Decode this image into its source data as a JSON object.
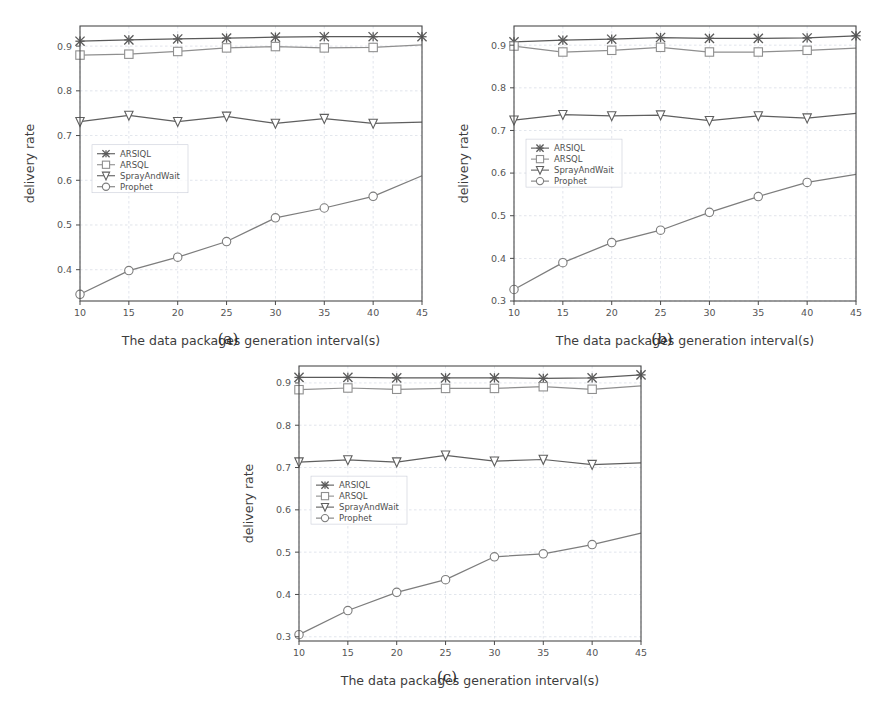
{
  "figure": {
    "panels": [
      {
        "id": "a",
        "caption": "(a)"
      },
      {
        "id": "b",
        "caption": "(b)"
      },
      {
        "id": "c",
        "caption": "(c)"
      }
    ]
  },
  "captions": {
    "a": "(a)",
    "b": "(b)",
    "c": "(c)"
  },
  "axis": {
    "xlabel": "The data packages generation interval(s)",
    "ylabel": "delivery rate"
  },
  "legend": {
    "entries": [
      "ARSIQL",
      "ARSQL",
      "SprayAndWait",
      "Prophet"
    ],
    "markers": [
      "x-marker-icon",
      "square-marker-icon",
      "triangle-down-marker-icon",
      "circle-marker-icon"
    ]
  },
  "colors": {
    "arsiql": "#5a5a5a",
    "arsql": "#8f8f8f",
    "sprayandwait": "#5f5f5f",
    "prophet": "#7d7d7d",
    "grid": "#cfd4e0",
    "axis": "#4a4a4a",
    "background": "#ffffff"
  },
  "chart_data": [
    {
      "type": "line",
      "panel": "(a)",
      "title": "",
      "xlabel": "The data packages generation interval(s)",
      "ylabel": "delivery rate",
      "x": [
        10,
        15,
        20,
        25,
        30,
        35,
        40,
        45
      ],
      "xlim": [
        10,
        45
      ],
      "ylim": [
        0.33,
        0.945
      ],
      "xticks": [
        10,
        15,
        20,
        25,
        30,
        35,
        40,
        45
      ],
      "yticks": [
        0.4,
        0.5,
        0.6,
        0.7,
        0.8,
        0.9
      ],
      "ytick_labels": [
        "0.4",
        "0.5",
        "0.6",
        "0.7",
        "0.8",
        "0.9"
      ],
      "grid": true,
      "legend_position": "center-left",
      "series": [
        {
          "name": "ARSIQL",
          "marker": "x",
          "values": [
            0.911,
            0.914,
            0.916,
            0.918,
            0.92,
            0.921,
            0.921,
            0.921
          ]
        },
        {
          "name": "ARSQL",
          "marker": "square",
          "values": [
            0.88,
            0.882,
            0.888,
            0.896,
            0.899,
            0.896,
            0.897,
            0.903
          ]
        },
        {
          "name": "SprayAndWait",
          "marker": "triangle",
          "values": [
            0.731,
            0.745,
            0.731,
            0.743,
            0.727,
            0.738,
            0.727,
            0.73
          ]
        },
        {
          "name": "Prophet",
          "marker": "circle",
          "values": [
            0.345,
            0.398,
            0.428,
            0.463,
            0.516,
            0.538,
            0.564,
            0.61
          ]
        }
      ]
    },
    {
      "type": "line",
      "panel": "(b)",
      "title": "",
      "xlabel": "The data packages generation interval(s)",
      "ylabel": "delivery rate",
      "x": [
        10,
        15,
        20,
        25,
        30,
        35,
        40,
        45
      ],
      "xlim": [
        10,
        45
      ],
      "ylim": [
        0.3,
        0.945
      ],
      "xticks": [
        10,
        15,
        20,
        25,
        30,
        35,
        40,
        45
      ],
      "yticks": [
        0.3,
        0.4,
        0.5,
        0.6,
        0.7,
        0.8,
        0.9
      ],
      "ytick_labels": [
        "0.3",
        "0.4",
        "0.5",
        "0.6",
        "0.7",
        "0.8",
        "0.9"
      ],
      "grid": true,
      "legend_position": "center-left",
      "series": [
        {
          "name": "ARSIQL",
          "marker": "x",
          "values": [
            0.908,
            0.912,
            0.914,
            0.918,
            0.916,
            0.916,
            0.917,
            0.922
          ]
        },
        {
          "name": "ARSQL",
          "marker": "square",
          "values": [
            0.898,
            0.884,
            0.888,
            0.895,
            0.884,
            0.884,
            0.888,
            0.893
          ]
        },
        {
          "name": "SprayAndWait",
          "marker": "triangle",
          "values": [
            0.724,
            0.737,
            0.734,
            0.736,
            0.723,
            0.734,
            0.729,
            0.74
          ]
        },
        {
          "name": "Prophet",
          "marker": "circle",
          "values": [
            0.327,
            0.39,
            0.437,
            0.466,
            0.508,
            0.545,
            0.578,
            0.597
          ]
        }
      ]
    },
    {
      "type": "line",
      "panel": "(c)",
      "title": "",
      "xlabel": "The data packages generation interval(s)",
      "ylabel": "delivery rate",
      "x": [
        10,
        15,
        20,
        25,
        30,
        35,
        40,
        45
      ],
      "xlim": [
        10,
        45
      ],
      "ylim": [
        0.29,
        0.94
      ],
      "xticks": [
        10,
        15,
        20,
        25,
        30,
        35,
        40,
        45
      ],
      "yticks": [
        0.3,
        0.4,
        0.5,
        0.6,
        0.7,
        0.8,
        0.9
      ],
      "ytick_labels": [
        "0.3",
        "0.4",
        "0.5",
        "0.6",
        "0.7",
        "0.8",
        "0.9"
      ],
      "grid": true,
      "legend_position": "center-left",
      "series": [
        {
          "name": "ARSIQL",
          "marker": "x",
          "values": [
            0.913,
            0.913,
            0.912,
            0.912,
            0.912,
            0.911,
            0.912,
            0.919
          ]
        },
        {
          "name": "ARSQL",
          "marker": "square",
          "values": [
            0.884,
            0.888,
            0.885,
            0.887,
            0.887,
            0.891,
            0.885,
            0.893
          ]
        },
        {
          "name": "SprayAndWait",
          "marker": "triangle",
          "values": [
            0.713,
            0.718,
            0.713,
            0.729,
            0.715,
            0.719,
            0.707,
            0.711
          ]
        },
        {
          "name": "Prophet",
          "marker": "circle",
          "values": [
            0.305,
            0.362,
            0.405,
            0.435,
            0.489,
            0.496,
            0.518,
            0.545
          ]
        }
      ]
    }
  ]
}
